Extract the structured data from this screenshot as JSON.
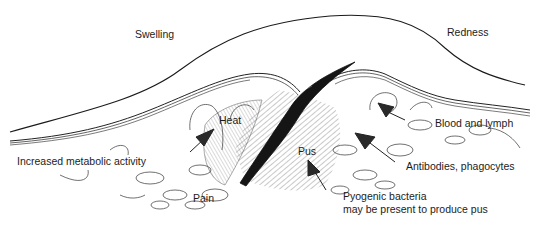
{
  "diagram": {
    "labels": {
      "swelling": "Swelling",
      "redness": "Redness",
      "heat": "Heat",
      "blood_lymph": "Blood and lymph",
      "metabolic": "Increased metabolic activity",
      "pus": "Pus",
      "antibodies": "Antibodies, phagocytes",
      "pain": "Pain",
      "bacteria_line1": "Pyogenic bacteria",
      "bacteria_line2": "may be present to produce pus"
    },
    "colors": {
      "ink": "#1a1a1a",
      "background": "#ffffff",
      "hatch": "#555555"
    }
  }
}
